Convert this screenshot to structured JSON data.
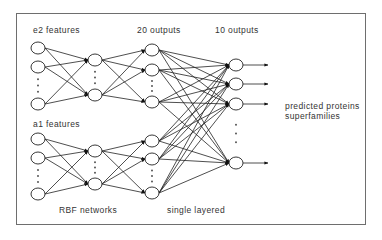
{
  "labels": {
    "e2_features": "e2 features",
    "a1_features": "a1 features",
    "outputs20": "20 outputs",
    "outputs10": "10 outputs",
    "rbf": "RBF networks",
    "single": "single layered",
    "predicted_line1": "predicted proteins",
    "predicted_line2": "superfamilies"
  },
  "network": {
    "groups": [
      {
        "name": "e2",
        "inputs": [
          48,
          67,
          104
        ],
        "hidden": [
          60,
          95
        ],
        "outputs": [
          50,
          70,
          102
        ]
      },
      {
        "name": "a1",
        "inputs": [
          139,
          158,
          194
        ],
        "hidden": [
          151,
          184
        ],
        "outputs": [
          141,
          159,
          193
        ]
      }
    ],
    "final": [
      65,
      84,
      104,
      163
    ],
    "x": {
      "input": 38,
      "hidden": 95,
      "output": 152,
      "final": 236,
      "arrow_end": 268
    },
    "node_rx": 7,
    "node_ry": 6
  }
}
